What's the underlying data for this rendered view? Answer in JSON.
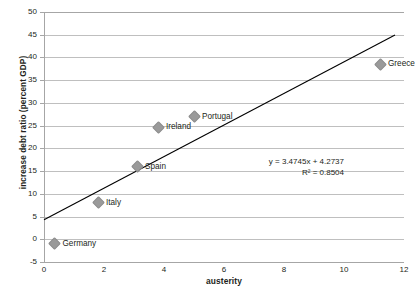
{
  "chart_data": {
    "type": "scatter",
    "title": "",
    "xlabel": "austerity",
    "ylabel": "increase debt ratio (percent GDP)",
    "xlim": [
      0,
      12
    ],
    "ylim": [
      -5,
      50
    ],
    "xticks": [
      "0",
      "2",
      "4",
      "6",
      "8",
      "10",
      "12"
    ],
    "yticks": [
      "-5",
      "0",
      "5",
      "10",
      "15",
      "20",
      "25",
      "30",
      "35",
      "40",
      "45",
      "50"
    ],
    "grid": "horizontal",
    "legend": "none",
    "marker_color": "#9a9a9a",
    "trendline_color": "#000000",
    "gridline_color": "#bfbfbf",
    "points": [
      {
        "label": "Germany",
        "x": 0.35,
        "y": -1.0
      },
      {
        "label": "Italy",
        "x": 1.8,
        "y": 8.0
      },
      {
        "label": "Spain",
        "x": 3.1,
        "y": 16.0
      },
      {
        "label": "Ireland",
        "x": 3.8,
        "y": 24.7
      },
      {
        "label": "Portugal",
        "x": 5.0,
        "y": 27.0
      },
      {
        "label": "Greece",
        "x": 11.2,
        "y": 38.5
      }
    ],
    "trendline": {
      "equation": "y = 3.4745x + 4.2737",
      "r_squared": "R² = 0.8504",
      "slope": 3.4745,
      "intercept": 4.2737,
      "x_start": 0.0,
      "x_end": 11.7
    },
    "annotation_position": {
      "x": 10.0,
      "y": 17.0
    }
  }
}
